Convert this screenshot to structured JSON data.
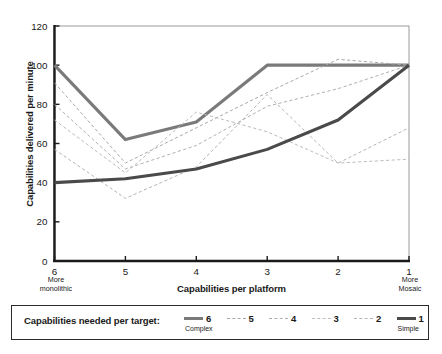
{
  "chart_data": {
    "type": "line",
    "title": "",
    "xlabel": "Capabilities per platform",
    "ylabel": "Capabilities delivered per minute",
    "categories": [
      "6",
      "5",
      "4",
      "3",
      "2",
      "1"
    ],
    "x_axis_left_note": "More\nmonolithic",
    "x_axis_right_note": "More\nMosaic",
    "x_left_note_line1": "More",
    "x_left_note_line2": "monolithic",
    "x_right_note_line1": "More",
    "x_right_note_line2": "Mosaic",
    "ylim": [
      0,
      120
    ],
    "yticks": [
      0,
      20,
      40,
      60,
      80,
      100,
      120
    ],
    "ytick_labels": [
      "0",
      "20",
      "40",
      "60",
      "80",
      "100",
      "120"
    ],
    "grid": false,
    "legend_position": "bottom",
    "series": [
      {
        "name": "6",
        "sublabel": "Complex",
        "style": "solid-thick",
        "color": "#7a7a7a",
        "values": [
          100,
          62,
          71,
          100,
          100,
          100
        ]
      },
      {
        "name": "5",
        "sublabel": "",
        "style": "dashed",
        "color": "#a8a8a8",
        "values": [
          91,
          50,
          68,
          86,
          103,
          100
        ]
      },
      {
        "name": "4",
        "sublabel": "",
        "style": "dashed",
        "color": "#b0b0b0",
        "values": [
          80,
          47,
          59,
          79,
          88,
          100
        ]
      },
      {
        "name": "3",
        "sublabel": "",
        "style": "dashed",
        "color": "#bdbdbd",
        "values": [
          72,
          45,
          76,
          66,
          50,
          52
        ]
      },
      {
        "name": "2",
        "sublabel": "",
        "style": "dashed",
        "color": "#b5b5b5",
        "values": [
          57,
          32,
          48,
          85,
          50,
          68
        ]
      },
      {
        "name": "1",
        "sublabel": "Simple",
        "style": "solid-thick",
        "color": "#4a4a4a",
        "values": [
          40,
          42,
          47,
          57,
          72,
          100
        ]
      }
    ]
  },
  "legend": {
    "title": "Capabilities needed per target:",
    "entries": [
      {
        "label": "6",
        "sublabel": "Complex"
      },
      {
        "label": "5",
        "sublabel": ""
      },
      {
        "label": "4",
        "sublabel": ""
      },
      {
        "label": "3",
        "sublabel": ""
      },
      {
        "label": "2",
        "sublabel": ""
      },
      {
        "label": "1",
        "sublabel": "Simple"
      }
    ]
  },
  "colors": {
    "axis": "#1a1a1a",
    "frame": "#9a9a9a",
    "series_complex": "#7a7a7a",
    "series_simple": "#4a4a4a",
    "dashed": "#b4b4b4"
  }
}
